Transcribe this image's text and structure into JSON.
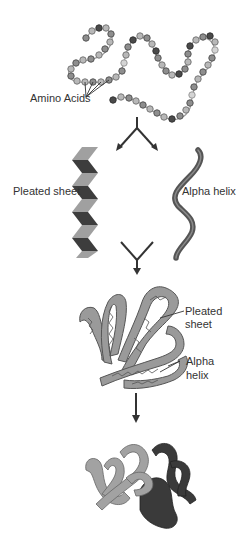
{
  "diagram": {
    "stages": [
      {
        "id": "primary",
        "name": "Primary structure"
      },
      {
        "id": "secondary",
        "name": "Secondary structure"
      },
      {
        "id": "tertiary",
        "name": "Tertiary structure"
      },
      {
        "id": "quaternary",
        "name": "Quaternary structure"
      }
    ],
    "labels": {
      "amino_acids": "Amino Acids",
      "pleated_sheet": "Pleated sheet",
      "alpha_helix": "Alpha helix",
      "tertiary_pleated_line1": "Pleated",
      "tertiary_pleated_line2": "sheet",
      "tertiary_alpha_line1": "Alpha",
      "tertiary_alpha_line2": "helix"
    },
    "colors": {
      "bead_light": "#b8b8b8",
      "bead_mid": "#8e8e8e",
      "bead_dark": "#4a4a4a",
      "sheet_light": "#a0a0a0",
      "sheet_dark": "#3d3d3d",
      "helix": "#555555",
      "tertiary_fill": "#9a9a9a",
      "quaternary_light": "#a2a2a2",
      "quaternary_dark": "#3a3a3a",
      "arrow": "#333333",
      "text": "#333333"
    }
  }
}
